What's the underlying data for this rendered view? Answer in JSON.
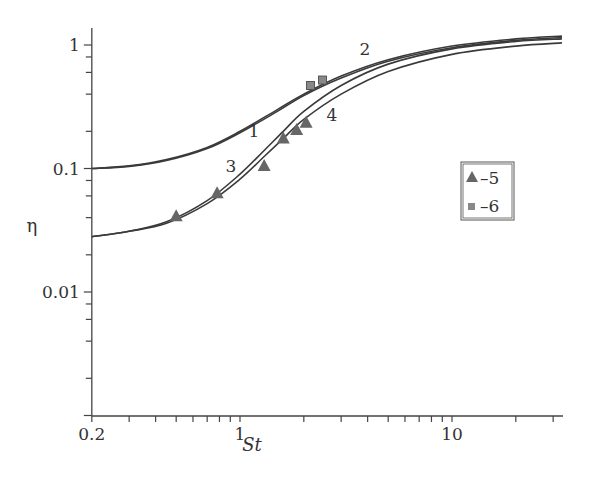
{
  "chart_data": {
    "type": "line",
    "title": "",
    "xlabel": "St",
    "ylabel": "η",
    "xscale": "log",
    "yscale": "log",
    "xlim": [
      0.2,
      33
    ],
    "ylim": [
      0.001,
      1.3
    ],
    "x_tick_labels": [
      "0.2",
      "1",
      "10"
    ],
    "y_tick_labels": [
      "1",
      "0.1",
      "0.01"
    ],
    "grid": false,
    "series": [
      {
        "name": "1",
        "type": "line",
        "x": [
          0.2,
          0.3,
          0.45,
          0.7,
          1.0,
          1.5,
          2.0,
          3.0,
          5.0,
          10.0,
          20.0,
          33.0
        ],
        "values": [
          0.1,
          0.105,
          0.118,
          0.148,
          0.2,
          0.3,
          0.4,
          0.56,
          0.76,
          0.98,
          1.12,
          1.18
        ]
      },
      {
        "name": "2",
        "type": "line",
        "x": [
          0.2,
          0.3,
          0.45,
          0.7,
          1.0,
          1.5,
          2.0,
          3.0,
          5.0,
          10.0,
          20.0,
          33.0
        ],
        "values": [
          0.1,
          0.104,
          0.116,
          0.145,
          0.195,
          0.29,
          0.39,
          0.54,
          0.74,
          0.95,
          1.09,
          1.15
        ]
      },
      {
        "name": "3",
        "type": "line",
        "x": [
          0.2,
          0.3,
          0.45,
          0.7,
          1.0,
          1.3,
          1.6,
          2.0,
          3.0,
          5.0,
          10.0,
          20.0,
          33.0
        ],
        "values": [
          0.028,
          0.031,
          0.037,
          0.055,
          0.09,
          0.14,
          0.2,
          0.29,
          0.47,
          0.7,
          0.93,
          1.07,
          1.12
        ]
      },
      {
        "name": "4",
        "type": "line",
        "x": [
          0.2,
          0.3,
          0.45,
          0.7,
          1.0,
          1.3,
          1.6,
          2.0,
          3.0,
          5.0,
          10.0,
          20.0,
          33.0
        ],
        "values": [
          0.028,
          0.031,
          0.036,
          0.052,
          0.082,
          0.125,
          0.175,
          0.25,
          0.4,
          0.61,
          0.84,
          0.98,
          1.04
        ]
      },
      {
        "name": "5",
        "type": "scatter",
        "marker": "triangle",
        "x": [
          0.5,
          0.78,
          1.3,
          1.6,
          1.85,
          2.05
        ],
        "values": [
          0.041,
          0.063,
          0.105,
          0.175,
          0.205,
          0.235
        ]
      },
      {
        "name": "6",
        "type": "scatter",
        "marker": "square",
        "x": [
          2.15,
          2.45
        ],
        "values": [
          0.47,
          0.52
        ]
      }
    ],
    "legend": {
      "position": "right-middle",
      "entries": [
        "▲ – 5",
        "■ – 6"
      ]
    },
    "annotations": [
      "1",
      "2",
      "3",
      "4"
    ]
  },
  "labels": {
    "x_ticks": [
      {
        "v": 0.2,
        "t": "0.2"
      },
      {
        "v": 1,
        "t": "1"
      },
      {
        "v": 10,
        "t": "10"
      }
    ],
    "y_ticks": [
      {
        "v": 1,
        "t": "1"
      },
      {
        "v": 0.1,
        "t": "0.1"
      },
      {
        "v": 0.01,
        "t": "0.01"
      }
    ],
    "curve_labels": [
      {
        "t": "1",
        "x": 254,
        "y": 137
      },
      {
        "t": "2",
        "x": 365,
        "y": 55
      },
      {
        "t": "3",
        "x": 231,
        "y": 172
      },
      {
        "t": "4",
        "x": 332,
        "y": 121
      }
    ],
    "legend": {
      "tri": "–5",
      "sq": "–6"
    }
  },
  "colors": {
    "axis": "#444444",
    "line": "#3a3a3a",
    "marker": "#666666",
    "square": "#888888"
  }
}
